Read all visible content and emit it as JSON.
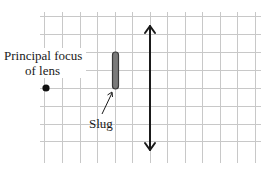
{
  "diagram": {
    "labels": {
      "focus_line1": "Principal focus",
      "focus_line2": "of lens",
      "slug": "Slug"
    },
    "grid": {
      "x_start": 44,
      "x_end": 261,
      "y_start": 16,
      "y_end": 160,
      "spacing": 17.6,
      "color": "#c8c8c8"
    },
    "lens": {
      "x": 150,
      "y_top": 24,
      "y_bottom": 152,
      "type": "converging-lens-arrow",
      "color": "#1a1a1a"
    },
    "slug": {
      "x": 115,
      "y_top": 52,
      "y_bottom": 89,
      "width": 6,
      "fill": "#7a7a7a",
      "stroke": "#3a3a3a"
    },
    "focus_point": {
      "x": 46,
      "y": 88,
      "r": 3.6,
      "color": "#111111"
    }
  }
}
